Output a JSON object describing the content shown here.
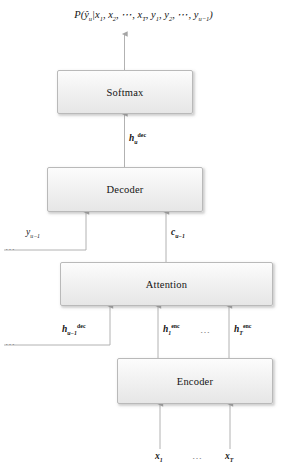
{
  "figure": {
    "title_formula": "P(ŷ_u|x_1, x_2, ⋯, x_T, y_1, y_2, ⋯, y_{u-1})",
    "background_color": "#ffffff",
    "box_fill": "#f0f0f0",
    "box_border": "#b9b9b9",
    "arrow_color": "#9a9a9a"
  },
  "output_formula": {
    "prefix": "P(",
    "y_hat": "ŷ",
    "y_hat_sub": "u",
    "bar": "|",
    "x1": "x",
    "x1_sub": "1",
    "comma1": ", ",
    "x2": "x",
    "x2_sub": "2",
    "comma2": ", ",
    "dots1": "⋯",
    "comma3": ", ",
    "xT": "x",
    "xT_sub": "T",
    "comma4": ", ",
    "y1": "y",
    "y1_sub": "1",
    "comma5": ", ",
    "y2": "y",
    "y2_sub": "2",
    "comma6": ", ",
    "dots2": "⋯",
    "comma7": ", ",
    "yu": "y",
    "yu_sub": "u−1",
    "suffix": ")"
  },
  "blocks": {
    "softmax": {
      "label": "Softmax"
    },
    "decoder": {
      "label": "Decoder"
    },
    "attention": {
      "label": "Attention"
    },
    "encoder": {
      "label": "Encoder"
    }
  },
  "signals": {
    "h_dec_u": {
      "base": "h",
      "sub": "u",
      "sup": "dec"
    },
    "h_dec_u_prev": {
      "base": "h",
      "sub": "u−1",
      "sup": "dec"
    },
    "h_enc_1": {
      "base": "h",
      "sub": "1",
      "sup": "enc"
    },
    "h_enc_T": {
      "base": "h",
      "sub": "T",
      "sup": "enc"
    },
    "c_u_prev": {
      "base": "c",
      "sub": "u−1"
    },
    "y_u_prev": {
      "base": "y",
      "sub": "u−1"
    },
    "x_1": {
      "base": "x",
      "sub": "1"
    },
    "x_T": {
      "base": "x",
      "sub": "T"
    }
  },
  "ellipses": {
    "enc_hidden_mid": "⋯",
    "enc_input_mid": "⋯",
    "left_decoder_feedback": "⋯",
    "left_attention_feedback": "⋯"
  }
}
